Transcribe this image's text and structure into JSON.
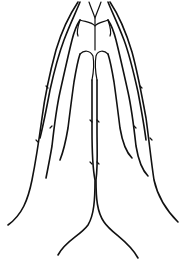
{
  "image": {
    "subject": "line drawing of praying hands",
    "background": "#ffffff",
    "stroke_color": "#111111"
  }
}
